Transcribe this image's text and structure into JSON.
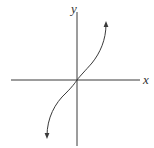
{
  "diagram": {
    "type": "function-graph",
    "axes": {
      "x_label": "x",
      "y_label": "y"
    },
    "curve": {
      "passes_through": "origin",
      "ends": [
        "arrow-up-right",
        "arrow-down-left"
      ]
    },
    "colors": {
      "line": "#3a3a3a",
      "background": "#ffffff"
    }
  }
}
